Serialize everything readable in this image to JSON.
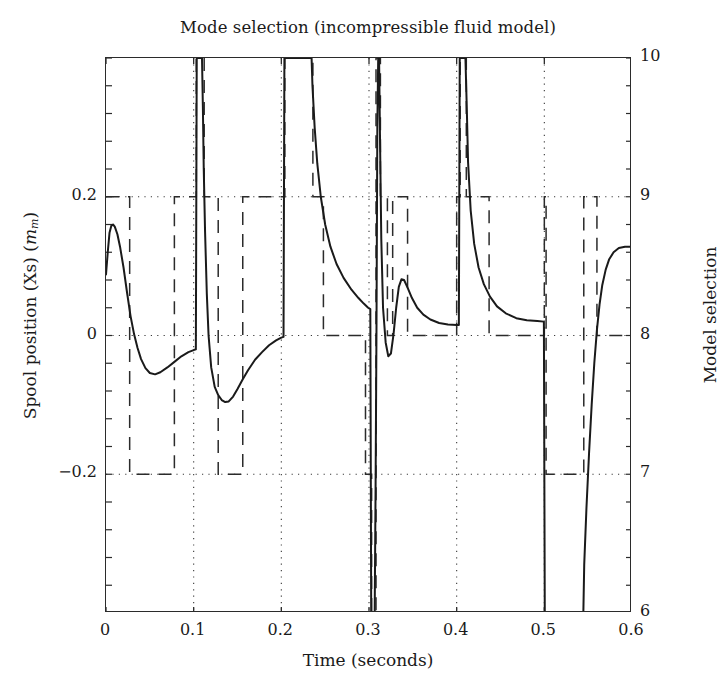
{
  "chart_data": {
    "type": "line",
    "title": "Mode selection (incompressible fluid model)",
    "xlabel": "Time (seconds)",
    "ylabel_left": "Spool position (Xs) (mm)",
    "ylabel_right": "Model selection",
    "xlim": [
      0,
      0.6
    ],
    "ylim_left": [
      -0.4,
      0.4
    ],
    "ylim_right": [
      6,
      10
    ],
    "xticks": [
      0,
      0.1,
      0.2,
      0.3,
      0.4,
      0.5,
      0.6
    ],
    "xtick_labels": [
      "0",
      "0.1",
      "0.2",
      "0.3",
      "0.4",
      "0.5",
      "0.6"
    ],
    "yticks_left": [
      0.2,
      0,
      -0.2
    ],
    "ytick_labels_left": [
      "0.2",
      "0",
      "−0.2"
    ],
    "yticks_right": [
      10,
      9,
      8,
      7,
      6
    ],
    "ytick_labels_right": [
      "10",
      "9",
      "8",
      "7",
      "6"
    ],
    "grid": "dotted",
    "legend_position": "none",
    "series": [
      {
        "name": "Spool position (Xs)",
        "axis": "left",
        "style": "solid",
        "color": "#1a1a1a",
        "linewidth": 2.0,
        "points": [
          [
            0.0,
            0.088
          ],
          [
            0.002,
            0.12
          ],
          [
            0.004,
            0.148
          ],
          [
            0.006,
            0.158
          ],
          [
            0.008,
            0.16
          ],
          [
            0.01,
            0.157
          ],
          [
            0.013,
            0.146
          ],
          [
            0.016,
            0.128
          ],
          [
            0.02,
            0.098
          ],
          [
            0.024,
            0.062
          ],
          [
            0.028,
            0.028
          ],
          [
            0.032,
            0.002
          ],
          [
            0.036,
            -0.018
          ],
          [
            0.04,
            -0.034
          ],
          [
            0.045,
            -0.047
          ],
          [
            0.05,
            -0.054
          ],
          [
            0.056,
            -0.056
          ],
          [
            0.062,
            -0.053
          ],
          [
            0.07,
            -0.046
          ],
          [
            0.078,
            -0.038
          ],
          [
            0.086,
            -0.03
          ],
          [
            0.094,
            -0.024
          ],
          [
            0.1,
            -0.021
          ],
          [
            0.1025,
            -0.02
          ],
          [
            0.1035,
            0.4
          ],
          [
            0.1045,
            0.4
          ],
          [
            0.1055,
            0.4
          ],
          [
            0.1075,
            0.4
          ],
          [
            0.1085,
            0.4
          ],
          [
            0.1095,
            0.4
          ],
          [
            0.1105,
            0.33
          ],
          [
            0.1115,
            0.24
          ],
          [
            0.113,
            0.15
          ],
          [
            0.115,
            0.06
          ],
          [
            0.117,
            0.0
          ],
          [
            0.12,
            -0.046
          ],
          [
            0.124,
            -0.074
          ],
          [
            0.128,
            -0.086
          ],
          [
            0.132,
            -0.093
          ],
          [
            0.136,
            -0.096
          ],
          [
            0.14,
            -0.095
          ],
          [
            0.145,
            -0.088
          ],
          [
            0.15,
            -0.077
          ],
          [
            0.156,
            -0.063
          ],
          [
            0.162,
            -0.05
          ],
          [
            0.17,
            -0.035
          ],
          [
            0.178,
            -0.024
          ],
          [
            0.186,
            -0.014
          ],
          [
            0.194,
            -0.007
          ],
          [
            0.2,
            -0.003
          ],
          [
            0.2025,
            -0.002
          ],
          [
            0.2035,
            0.4
          ],
          [
            0.21,
            0.4
          ],
          [
            0.22,
            0.4
          ],
          [
            0.23,
            0.4
          ],
          [
            0.2345,
            0.4
          ],
          [
            0.2355,
            0.36
          ],
          [
            0.238,
            0.3
          ],
          [
            0.241,
            0.248
          ],
          [
            0.245,
            0.2
          ],
          [
            0.25,
            0.16
          ],
          [
            0.256,
            0.128
          ],
          [
            0.263,
            0.103
          ],
          [
            0.271,
            0.083
          ],
          [
            0.28,
            0.066
          ],
          [
            0.288,
            0.054
          ],
          [
            0.294,
            0.046
          ],
          [
            0.299,
            0.04
          ],
          [
            0.3015,
            0.038
          ],
          [
            0.3025,
            -0.4
          ],
          [
            0.3045,
            -0.4
          ],
          [
            0.3055,
            -0.4
          ],
          [
            0.3065,
            -0.4
          ],
          [
            0.3075,
            -0.22
          ],
          [
            0.3085,
            0.0
          ],
          [
            0.3095,
            0.3
          ],
          [
            0.3105,
            0.4
          ],
          [
            0.3115,
            0.4
          ],
          [
            0.3125,
            0.29
          ],
          [
            0.314,
            0.14
          ],
          [
            0.316,
            0.04
          ],
          [
            0.319,
            -0.01
          ],
          [
            0.322,
            -0.03
          ],
          [
            0.325,
            -0.026
          ],
          [
            0.328,
            0.002
          ],
          [
            0.331,
            0.04
          ],
          [
            0.334,
            0.07
          ],
          [
            0.337,
            0.081
          ],
          [
            0.34,
            0.08
          ],
          [
            0.344,
            0.069
          ],
          [
            0.349,
            0.054
          ],
          [
            0.355,
            0.04
          ],
          [
            0.362,
            0.03
          ],
          [
            0.37,
            0.023
          ],
          [
            0.38,
            0.018
          ],
          [
            0.39,
            0.016
          ],
          [
            0.4,
            0.015
          ],
          [
            0.4025,
            0.015
          ],
          [
            0.4035,
            0.4
          ],
          [
            0.406,
            0.4
          ],
          [
            0.408,
            0.4
          ],
          [
            0.41,
            0.4
          ],
          [
            0.4115,
            0.33
          ],
          [
            0.413,
            0.25
          ],
          [
            0.416,
            0.18
          ],
          [
            0.42,
            0.132
          ],
          [
            0.425,
            0.098
          ],
          [
            0.431,
            0.074
          ],
          [
            0.438,
            0.056
          ],
          [
            0.446,
            0.042
          ],
          [
            0.456,
            0.032
          ],
          [
            0.468,
            0.025
          ],
          [
            0.48,
            0.022
          ],
          [
            0.492,
            0.021
          ],
          [
            0.4995,
            0.02
          ],
          [
            0.5005,
            -0.4
          ],
          [
            0.51,
            -0.4
          ],
          [
            0.525,
            -0.4
          ],
          [
            0.54,
            -0.4
          ],
          [
            0.5445,
            -0.4
          ],
          [
            0.5455,
            -0.33
          ],
          [
            0.548,
            -0.25
          ],
          [
            0.551,
            -0.17
          ],
          [
            0.554,
            -0.1
          ],
          [
            0.557,
            -0.04
          ],
          [
            0.56,
            0.008
          ],
          [
            0.563,
            0.045
          ],
          [
            0.566,
            0.072
          ],
          [
            0.57,
            0.095
          ],
          [
            0.574,
            0.11
          ],
          [
            0.579,
            0.12
          ],
          [
            0.585,
            0.126
          ],
          [
            0.592,
            0.128
          ],
          [
            0.6,
            0.128
          ]
        ]
      },
      {
        "name": "Model selection",
        "axis": "right",
        "style": "dashed",
        "color": "#2b2b2b",
        "linewidth": 1.5,
        "steps": [
          [
            0.0,
            9
          ],
          [
            0.027,
            9
          ],
          [
            0.027,
            7
          ],
          [
            0.078,
            7
          ],
          [
            0.078,
            9
          ],
          [
            0.103,
            9
          ],
          [
            0.103,
            10
          ],
          [
            0.112,
            10
          ],
          [
            0.112,
            9
          ],
          [
            0.128,
            9
          ],
          [
            0.128,
            7
          ],
          [
            0.156,
            7
          ],
          [
            0.156,
            9
          ],
          [
            0.204,
            9
          ],
          [
            0.204,
            10
          ],
          [
            0.236,
            10
          ],
          [
            0.236,
            9
          ],
          [
            0.248,
            9
          ],
          [
            0.248,
            8
          ],
          [
            0.296,
            8
          ],
          [
            0.296,
            7
          ],
          [
            0.303,
            7
          ],
          [
            0.303,
            6
          ],
          [
            0.308,
            6
          ],
          [
            0.308,
            10
          ],
          [
            0.313,
            10
          ],
          [
            0.313,
            9
          ],
          [
            0.321,
            9
          ],
          [
            0.321,
            8
          ],
          [
            0.327,
            8
          ],
          [
            0.327,
            9
          ],
          [
            0.344,
            9
          ],
          [
            0.344,
            8
          ],
          [
            0.4,
            8
          ],
          [
            0.4,
            9
          ],
          [
            0.404,
            9
          ],
          [
            0.404,
            10
          ],
          [
            0.411,
            10
          ],
          [
            0.411,
            9
          ],
          [
            0.437,
            9
          ],
          [
            0.437,
            8
          ],
          [
            0.5,
            8
          ],
          [
            0.5,
            9
          ],
          [
            0.502,
            9
          ],
          [
            0.502,
            7
          ],
          [
            0.545,
            7
          ],
          [
            0.545,
            9
          ],
          [
            0.56,
            9
          ],
          [
            0.56,
            8
          ],
          [
            0.6,
            8
          ]
        ]
      }
    ]
  }
}
